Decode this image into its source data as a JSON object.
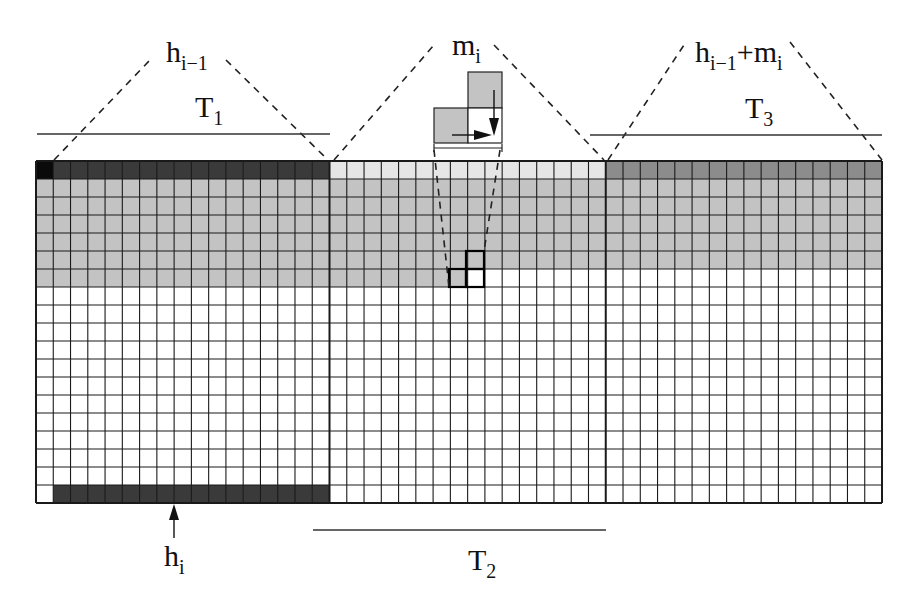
{
  "diagram": {
    "grid": {
      "x0": 36,
      "y0": 161,
      "x1": 882,
      "y1": 503,
      "rows": 19,
      "columns_total": 49,
      "sections": [
        {
          "name": "T1",
          "start_col": 0,
          "cols": 17
        },
        {
          "name": "T2",
          "start_col": 17,
          "cols": 16
        },
        {
          "name": "T3",
          "start_col": 33,
          "cols": 16
        }
      ]
    },
    "colors": {
      "black": "#0a0a0a",
      "dark": "#3a3a3a",
      "medium_dark": "#8c8c8c",
      "gray": "#c3c3c3",
      "light": "#e6e6e6",
      "white": "#ffffff",
      "line": "#1a1a1a"
    },
    "labels": {
      "top_T1": {
        "base": "h",
        "sub": "i−1"
      },
      "T1": {
        "base": "T",
        "sub": "1"
      },
      "top_T2": {
        "base": "m",
        "sub": "i"
      },
      "top_T3_part1": {
        "base": "h",
        "sub": "i−1"
      },
      "top_T3_plus": "+",
      "top_T3_part2": {
        "base": "m",
        "sub": "i"
      },
      "T3": {
        "base": "T",
        "sub": "3"
      },
      "bottom_h": {
        "base": "h",
        "sub": "i"
      },
      "T2": {
        "base": "T",
        "sub": "2"
      }
    }
  }
}
